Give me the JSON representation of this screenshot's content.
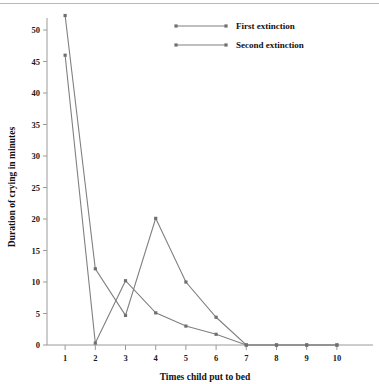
{
  "chart_data": {
    "type": "line",
    "title": "",
    "xlabel": "Times child put to bed",
    "ylabel": "Duration of crying in minutes",
    "x": [
      1,
      2,
      3,
      4,
      5,
      6,
      7,
      8,
      9,
      10
    ],
    "xlim": [
      0.4,
      10.6
    ],
    "ylim": [
      0,
      53
    ],
    "yticks": [
      0,
      5,
      10,
      15,
      20,
      25,
      30,
      35,
      40,
      45,
      50
    ],
    "ytick_labels": [
      "0",
      "5",
      "10",
      "15",
      "20",
      "25",
      "30",
      "35",
      "40",
      "45",
      "50"
    ],
    "xtick_labels": [
      "1",
      "2",
      "3",
      "4",
      "5",
      "6",
      "7",
      "8",
      "9",
      "10"
    ],
    "grid": false,
    "legend_position": "top-center",
    "series": [
      {
        "name": "First extinction",
        "values": [
          46,
          0.3,
          10.2,
          5.1,
          3.0,
          1.7,
          0,
          0,
          0,
          0
        ],
        "color": "#808080"
      },
      {
        "name": "Second extinction",
        "values": [
          52.3,
          12.1,
          4.7,
          20.1,
          10.0,
          4.4,
          0,
          0,
          0,
          0
        ],
        "color": "#808080"
      }
    ]
  },
  "legend": {
    "entries": [
      {
        "label": "First extinction"
      },
      {
        "label": "Second extinction"
      }
    ]
  },
  "axes": {
    "y_title": "Duration of crying in minutes",
    "x_title": "Times child put to bed"
  },
  "colors": {
    "line": "#808080",
    "marker": "#6f6f6f",
    "axis": "#9a9a9a",
    "text": "#111111",
    "background": "#ffffff",
    "top_rule": "#b9b9b9"
  }
}
